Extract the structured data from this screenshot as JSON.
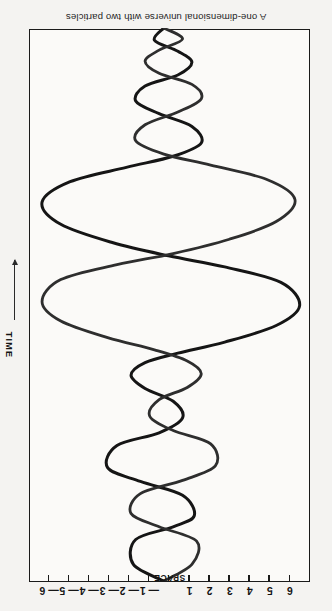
{
  "figure": {
    "caption": "A one-dimensional universe with two particles",
    "orientation": "upside-down",
    "background_color": "#f4f3f1",
    "plot_background_color": "#fbfaf8",
    "frame_color": "#1a1a1a"
  },
  "space_axis": {
    "title": "SPACE",
    "position": "top",
    "tick_labels": [
      "6",
      "5",
      "4",
      "3",
      "2",
      "1",
      "",
      "— 1",
      "— 2",
      "— 3",
      "— 4",
      "— 5",
      "— 6"
    ],
    "tick_values": [
      6,
      5,
      4,
      3,
      2,
      1,
      0,
      -1,
      -2,
      -3,
      -4,
      -5,
      -6
    ]
  },
  "time_axis": {
    "title": "TIME",
    "position": "right",
    "arrow_direction": "down",
    "arrow_color": "#2a2a2a"
  },
  "chart_data": {
    "type": "line",
    "title": "A one-dimensional universe with two particles",
    "xlabel": "SPACE",
    "ylabel": "TIME",
    "xlim": [
      6,
      -6
    ],
    "ylim": [
      0,
      1
    ],
    "grid": false,
    "legend": null,
    "x_tick_labels": [
      "6",
      "5",
      "4",
      "3",
      "2",
      "1",
      "",
      "— 1",
      "— 2",
      "— 3",
      "— 4",
      "— 5",
      "— 6"
    ],
    "x_ticks": [
      6,
      5,
      4,
      3,
      2,
      1,
      0,
      -1,
      -2,
      -3,
      -4,
      -5,
      -6
    ],
    "annotation": "Two particle worldlines oscillate about each other, with large amplitude swings near the middle of the time axis damping toward both ends.",
    "series": [
      {
        "name": "particle-1-worldline",
        "color": "#151515",
        "stroke_width": 3.0,
        "points": [
          [
            -0.2,
            0.0
          ],
          [
            -1.5,
            0.03
          ],
          [
            -1.4,
            0.075
          ],
          [
            0.2,
            0.098
          ],
          [
            1.1,
            0.118
          ],
          [
            0.6,
            0.155
          ],
          [
            -1.2,
            0.18
          ],
          [
            -2.6,
            0.205
          ],
          [
            -2.2,
            0.245
          ],
          [
            -0.4,
            0.268
          ],
          [
            0.6,
            0.295
          ],
          [
            0.2,
            0.325
          ],
          [
            -1.0,
            0.348
          ],
          [
            -1.6,
            0.372
          ],
          [
            -1.0,
            0.395
          ],
          [
            0.4,
            0.412
          ],
          [
            2.4,
            0.432
          ],
          [
            4.6,
            0.462
          ],
          [
            5.6,
            0.498
          ],
          [
            4.8,
            0.54
          ],
          [
            2.4,
            0.568
          ],
          [
            0.0,
            0.588
          ],
          [
            -2.4,
            0.612
          ],
          [
            -4.6,
            0.645
          ],
          [
            -5.4,
            0.685
          ],
          [
            -4.2,
            0.722
          ],
          [
            -1.8,
            0.748
          ],
          [
            0.2,
            0.768
          ],
          [
            1.4,
            0.792
          ],
          [
            1.0,
            0.822
          ],
          [
            -0.4,
            0.845
          ],
          [
            -1.4,
            0.868
          ],
          [
            -1.0,
            0.895
          ],
          [
            0.4,
            0.915
          ],
          [
            1.0,
            0.938
          ],
          [
            0.4,
            0.958
          ],
          [
            -0.6,
            0.978
          ],
          [
            -0.2,
            1.0
          ]
        ]
      },
      {
        "name": "particle-2-worldline",
        "color": "#2e2e2e",
        "stroke_width": 2.8,
        "points": [
          [
            -0.2,
            0.0
          ],
          [
            1.0,
            0.03
          ],
          [
            1.2,
            0.072
          ],
          [
            -0.4,
            0.098
          ],
          [
            -1.6,
            0.122
          ],
          [
            -1.2,
            0.158
          ],
          [
            0.6,
            0.182
          ],
          [
            2.0,
            0.208
          ],
          [
            1.8,
            0.248
          ],
          [
            0.2,
            0.272
          ],
          [
            -0.8,
            0.298
          ],
          [
            -0.4,
            0.328
          ],
          [
            0.8,
            0.35
          ],
          [
            1.4,
            0.375
          ],
          [
            0.8,
            0.398
          ],
          [
            -0.6,
            0.418
          ],
          [
            -2.6,
            0.44
          ],
          [
            -4.6,
            0.47
          ],
          [
            -5.4,
            0.505
          ],
          [
            -4.6,
            0.545
          ],
          [
            -2.2,
            0.572
          ],
          [
            0.2,
            0.592
          ],
          [
            2.6,
            0.618
          ],
          [
            4.6,
            0.65
          ],
          [
            5.4,
            0.69
          ],
          [
            4.2,
            0.726
          ],
          [
            1.8,
            0.752
          ],
          [
            -0.2,
            0.772
          ],
          [
            -1.4,
            0.796
          ],
          [
            -1.0,
            0.825
          ],
          [
            0.4,
            0.848
          ],
          [
            1.4,
            0.872
          ],
          [
            1.0,
            0.898
          ],
          [
            -0.4,
            0.918
          ],
          [
            -1.0,
            0.94
          ],
          [
            -0.4,
            0.96
          ],
          [
            0.6,
            0.98
          ],
          [
            -0.2,
            1.0
          ]
        ]
      }
    ]
  }
}
